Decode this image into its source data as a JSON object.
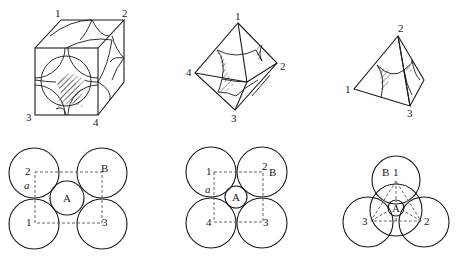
{
  "top_strip": {
    "text": ""
  },
  "figures": {
    "cube": {
      "name": "face-centered cubic octahedral void",
      "labels": {
        "v1": "1",
        "v2": "2",
        "v3": "3",
        "v4": "4"
      }
    },
    "octahedron": {
      "name": "octahedral void",
      "labels": {
        "v1": "1",
        "v2": "2",
        "v3": "3",
        "v4": "4"
      }
    },
    "tetrahedron": {
      "name": "tetrahedral void",
      "labels": {
        "v1": "1",
        "v2": "2",
        "v3": "3"
      }
    },
    "square_layer_a": {
      "labels": {
        "s1": "1",
        "s2": "2",
        "s3": "3",
        "b": "B",
        "a_len": "a",
        "center": "A"
      }
    },
    "square_layer_b": {
      "labels": {
        "s1": "1",
        "s2": "2",
        "s3": "3",
        "s4": "4",
        "b": "B",
        "a_len": "a",
        "center": "A"
      }
    },
    "triangle_layer": {
      "labels": {
        "s1": "1",
        "s2": "2",
        "s3": "3",
        "b": "B",
        "center": "A"
      }
    }
  },
  "colors": {
    "line": "#1a1a1a",
    "dash": "#555555",
    "background": "#ffffff"
  }
}
